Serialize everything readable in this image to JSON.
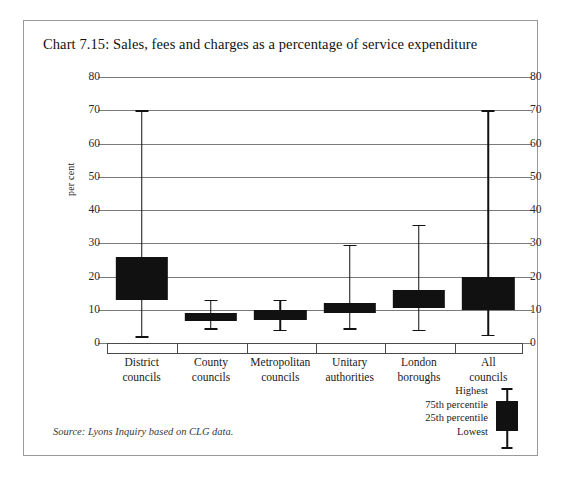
{
  "figure": {
    "title": "Chart 7.15: Sales, fees and charges as a percentage of service expenditure",
    "source": "Source: Lyons Inquiry based on CLG data.",
    "y_axis_title": "per cent"
  },
  "legend": {
    "highest_label": "Highest",
    "p75_label": "75th percentile",
    "p25_label": "25th percentile",
    "lowest_label": "Lowest"
  },
  "chart_data": {
    "type": "box",
    "title": "Chart 7.15: Sales, fees and charges as a percentage of service expenditure",
    "xlabel": "",
    "ylabel": "per cent",
    "ylim": [
      0,
      80
    ],
    "yticks": [
      0,
      10,
      20,
      30,
      40,
      50,
      60,
      70,
      80
    ],
    "ytick_labels": [
      "0",
      "10",
      "20",
      "30",
      "40",
      "50",
      "60",
      "70",
      "80"
    ],
    "grid": true,
    "dual_axis": true,
    "legend_position": "bottom-right",
    "categories": [
      "District councils",
      "County councils",
      "Metropolitan councils",
      "Unitary authorities",
      "London boroughs",
      "All councils"
    ],
    "category_lines": [
      [
        "District",
        "councils"
      ],
      [
        "County",
        "councils"
      ],
      [
        "Metropolitan",
        "councils"
      ],
      [
        "Unitary",
        "authorities"
      ],
      [
        "London",
        "boroughs"
      ],
      [
        "All",
        "councils"
      ]
    ],
    "series": [
      {
        "name": "Sales, fees and charges (% of service expenditure)",
        "stats_keys": [
          "lowest",
          "p25",
          "p75",
          "highest"
        ],
        "boxes": [
          {
            "category": "District councils",
            "lowest": 2.0,
            "p25": 13.0,
            "p75": 26.0,
            "highest": 70.0
          },
          {
            "category": "County councils",
            "lowest": 4.5,
            "p25": 6.5,
            "p75": 9.0,
            "highest": 13.0
          },
          {
            "category": "Metropolitan councils",
            "lowest": 4.0,
            "p25": 7.0,
            "p75": 10.0,
            "highest": 13.0
          },
          {
            "category": "Unitary authorities",
            "lowest": 4.5,
            "p25": 9.0,
            "p75": 12.0,
            "highest": 29.5
          },
          {
            "category": "London boroughs",
            "lowest": 4.0,
            "p25": 10.5,
            "p75": 16.0,
            "highest": 35.5
          },
          {
            "category": "All councils",
            "lowest": 2.5,
            "p25": 10.0,
            "p75": 20.0,
            "highest": 70.0
          }
        ]
      }
    ]
  },
  "colors": {
    "box_fill": "#111111",
    "grid": "#7b7b7b",
    "frame": "#9a9a9a",
    "text": "#1a1a1a"
  }
}
